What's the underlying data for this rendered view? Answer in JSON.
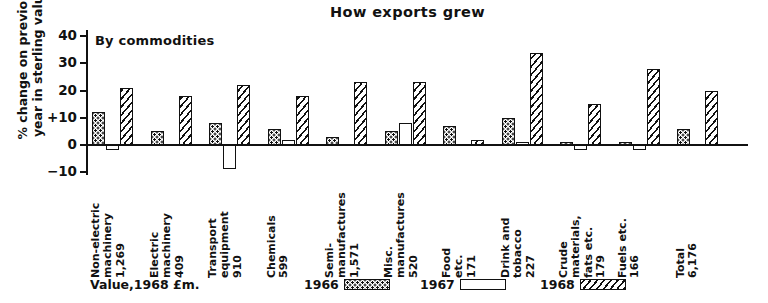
{
  "chart_data": {
    "type": "bar",
    "title": "How exports grew",
    "subtitle": "By commodities",
    "xlabel": "",
    "ylabel": "% change on previous\nyear in sterling value",
    "ylim": [
      -10,
      40
    ],
    "yticks": [
      40,
      30,
      20,
      10,
      0,
      -10
    ],
    "ytick_labels": [
      "40",
      "30",
      "20",
      "+10",
      "0",
      "−10"
    ],
    "grid": false,
    "legend_position": "bottom",
    "value_note": "Value,1968 £m.",
    "categories": [
      "Non-electric\nmachinery\n1,269",
      "Electric\nmachinery\n409",
      "Transport\nequipment\n910",
      "Chemicals\n599",
      "Semi-\nmanufactures\n1,571",
      "Misc.\nmanufactures\n520",
      "Food\netc.\n171",
      "Drink and\ntobacco\n227",
      "Crude materials,\nfats etc.\n179",
      "Fuels etc.\n166",
      "Total\n6,176"
    ],
    "category_names": [
      "Non-electric machinery",
      "Electric machinery",
      "Transport equipment",
      "Chemicals",
      "Semi-manufactures",
      "Misc. manufactures",
      "Food etc.",
      "Drink and tobacco",
      "Crude materials, fats etc.",
      "Fuels etc.",
      "Total"
    ],
    "category_values_1968_gbp_m": [
      "1,269",
      "409",
      "910",
      "599",
      "1,571",
      "520",
      "171",
      "227",
      "179",
      "166",
      "6,176"
    ],
    "series": [
      {
        "name": "1966",
        "fill": "dotted",
        "values": [
          12,
          5,
          8,
          6,
          3,
          5,
          7,
          10,
          1,
          1,
          6
        ]
      },
      {
        "name": "1967",
        "fill": "blank",
        "values": [
          -2,
          0,
          -9,
          2,
          0,
          8,
          0,
          1,
          -2,
          -2,
          0
        ]
      },
      {
        "name": "1968",
        "fill": "hatched",
        "values": [
          21,
          18,
          22,
          18,
          23,
          23,
          2,
          34,
          15,
          28,
          20
        ]
      }
    ]
  },
  "legend": {
    "note": "Value,1968 £m.",
    "items": [
      {
        "label": "1966",
        "fill": "dotted"
      },
      {
        "label": "1967",
        "fill": "blank"
      },
      {
        "label": "1968",
        "fill": "hatched"
      }
    ]
  },
  "colors": {
    "ink": "#111111",
    "paper": "#ffffff"
  }
}
